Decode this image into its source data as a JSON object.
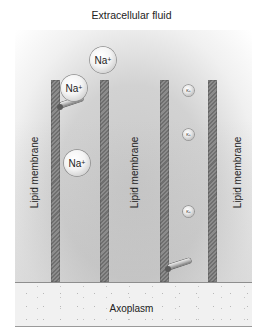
{
  "diagram": {
    "title": "Extracellular fluid",
    "bottom_region_label": "Axoplasm",
    "membrane_labels": [
      "Lipid membrane",
      "Lipid membrane",
      "Lipid membrane"
    ],
    "channels": [
      {
        "name": "sodium-channel",
        "gate_state": "open",
        "ions": [
          {
            "symbol": "Na",
            "charge": "+",
            "position": "above-channel"
          },
          {
            "symbol": "Na",
            "charge": "+",
            "position": "entering-channel"
          },
          {
            "symbol": "Na",
            "charge": "+",
            "position": "inside-channel"
          }
        ]
      },
      {
        "name": "potassium-channel",
        "gate_state": "open",
        "ions": [
          {
            "symbol": "K",
            "charge": "+",
            "position": "top"
          },
          {
            "symbol": "K",
            "charge": "+",
            "position": "upper-middle"
          },
          {
            "symbol": "K",
            "charge": "+",
            "position": "lower-middle"
          }
        ]
      }
    ],
    "ion_labels": {
      "na_symbol": "Na",
      "na_charge": "+",
      "k_symbol": "K",
      "k_charge": "+"
    }
  }
}
